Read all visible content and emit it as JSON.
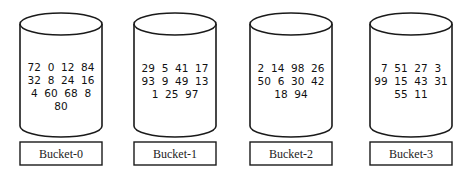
{
  "diagram": {
    "buckets": [
      {
        "label": "Bucket-0",
        "rows": [
          "72  0  12  84",
          "32  8  24  16",
          "4  60  68  8",
          "80"
        ],
        "values": [
          72,
          0,
          12,
          84,
          32,
          8,
          24,
          16,
          4,
          60,
          68,
          8,
          80
        ]
      },
      {
        "label": "Bucket-1",
        "rows": [
          "29  5  41  17",
          "93  9  49  13",
          "1  25  97"
        ],
        "values": [
          29,
          5,
          41,
          17,
          93,
          9,
          49,
          13,
          1,
          25,
          97
        ]
      },
      {
        "label": "Bucket-2",
        "rows": [
          "2  14  98  26",
          "50  6  30  42",
          "18  94"
        ],
        "values": [
          2,
          14,
          98,
          26,
          50,
          6,
          30,
          42,
          18,
          94
        ]
      },
      {
        "label": "Bucket-3",
        "rows": [
          "7  51  27  3",
          "99  15  43  31",
          "55  11"
        ],
        "values": [
          7,
          51,
          27,
          3,
          99,
          15,
          43,
          31,
          55,
          11
        ]
      }
    ]
  }
}
